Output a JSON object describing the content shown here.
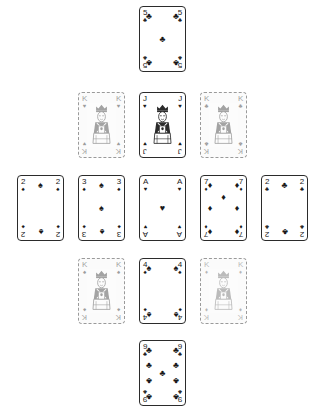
{
  "board": {
    "background_color": "#ffffff",
    "width": 325,
    "height": 412,
    "layout": "pyramid",
    "ink_color": "#1a1a1a",
    "solid_border_color": "#2b2b2b",
    "ghost_border_color": "#9a9a9a"
  },
  "suits": {
    "spades": "♠",
    "hearts": "♥",
    "diamonds": "♦",
    "clubs": "♣"
  },
  "rows": [
    {
      "name": "row-1",
      "top": 6,
      "gap": 14,
      "cards": [
        {
          "rank": "5",
          "suit": "clubs",
          "suit_glyph": "♣",
          "style": "solid",
          "color": "black",
          "label": "5 of Clubs"
        }
      ]
    },
    {
      "name": "row-2",
      "top": 92,
      "gap": 14,
      "cards": [
        {
          "rank": "K",
          "suit": "hearts",
          "suit_glyph": "♥",
          "style": "ghost",
          "color": "black",
          "label": "King of Hearts"
        },
        {
          "rank": "J",
          "suit": "hearts",
          "suit_glyph": "♥",
          "style": "solid",
          "color": "black",
          "label": "Jack of Hearts"
        },
        {
          "rank": "K",
          "suit": "clubs",
          "suit_glyph": "♣",
          "style": "ghost",
          "color": "black",
          "label": "King of Clubs"
        }
      ]
    },
    {
      "name": "row-3",
      "top": 175,
      "gap": 14,
      "cards": [
        {
          "rank": "2",
          "suit": "spades",
          "suit_glyph": "♠",
          "style": "solid",
          "color": "black",
          "label": "2 of Spades"
        },
        {
          "rank": "3",
          "suit": "spades",
          "suit_glyph": "♠",
          "style": "solid",
          "color": "black",
          "label": "3 of Spades"
        },
        {
          "rank": "A",
          "suit": "hearts",
          "suit_glyph": "♥",
          "style": "solid",
          "color": "black",
          "label": "Ace of Hearts"
        },
        {
          "rank": "7",
          "suit": "diamonds",
          "suit_glyph": "♦",
          "style": "solid",
          "color": "black",
          "label": "7 of Diamonds"
        },
        {
          "rank": "2",
          "suit": "clubs",
          "suit_glyph": "♣",
          "style": "solid",
          "color": "black",
          "label": "2 of Clubs"
        }
      ]
    },
    {
      "name": "row-4",
      "top": 258,
      "gap": 14,
      "cards": [
        {
          "rank": "K",
          "suit": "spades",
          "suit_glyph": "♠",
          "style": "ghost",
          "color": "black",
          "label": "King of Spades"
        },
        {
          "rank": "4",
          "suit": "spades",
          "suit_glyph": "♠",
          "style": "solid",
          "color": "black",
          "label": "4 of Spades"
        },
        {
          "rank": "K",
          "suit": "diamonds",
          "suit_glyph": "♦",
          "style": "ghost-faint",
          "color": "black",
          "label": "King of Diamonds"
        }
      ]
    },
    {
      "name": "row-5",
      "top": 340,
      "gap": 14,
      "cards": [
        {
          "rank": "9",
          "suit": "clubs",
          "suit_glyph": "♣",
          "style": "solid",
          "color": "black",
          "label": "9 of Clubs"
        }
      ]
    }
  ]
}
